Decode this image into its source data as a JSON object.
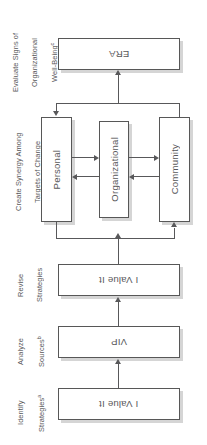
{
  "diagram": {
    "orientation": "rotated-180",
    "text_color": "#58585a",
    "border_color": "#575757",
    "shadow_color": "#bebebe",
    "background": "#ffffff"
  },
  "stages": [
    {
      "id": "evaluate",
      "label_line1": "Evaluate Signs of",
      "label_line2": "Organizational",
      "label_line3": "Well-Being",
      "footnote": "c"
    },
    {
      "id": "synergy",
      "label_line1": "Create Synergy Among",
      "label_line2": "Targets of Change",
      "footnote": ""
    },
    {
      "id": "revise",
      "label_line1": "Revise",
      "label_line2": "Strategies",
      "footnote": ""
    },
    {
      "id": "analyze",
      "label_line1": "Analyze",
      "label_line2": "Sources",
      "footnote": "b"
    },
    {
      "id": "identify",
      "label_line1": "Identify",
      "label_line2": "Strategies",
      "footnote": "a"
    }
  ],
  "nodes": {
    "era": "ERA",
    "personal": "Personal",
    "organizational": "Organizational",
    "community": "Community",
    "revise_box": "I Value It",
    "analyze_box": "VIP",
    "identify_box": "I Value It"
  },
  "connectors": [
    {
      "id": "identify-to-analyze",
      "from": "identify_box",
      "to": "analyze_box",
      "direction": "up"
    },
    {
      "id": "analyze-to-revise",
      "from": "analyze_box",
      "to": "revise_box",
      "direction": "up"
    },
    {
      "id": "revise-to-synergy",
      "from": "revise_box",
      "to": "synergy-group",
      "direction": "up"
    },
    {
      "id": "synergy-to-personal",
      "from": "synergy-bus",
      "to": "personal",
      "direction": "down"
    },
    {
      "id": "personal-to-organizational",
      "from": "personal",
      "to": "organizational",
      "direction": "right"
    },
    {
      "id": "organizational-to-personal",
      "from": "organizational",
      "to": "personal",
      "direction": "left"
    },
    {
      "id": "organizational-to-community",
      "from": "organizational",
      "to": "community",
      "direction": "right"
    },
    {
      "id": "community-to-organizational",
      "from": "community",
      "to": "organizational",
      "direction": "left"
    },
    {
      "id": "synergy-to-era",
      "from": "synergy-group",
      "to": "era",
      "direction": "up"
    },
    {
      "id": "feed-to-community",
      "from": "revise-bus",
      "to": "community",
      "direction": "up"
    }
  ]
}
